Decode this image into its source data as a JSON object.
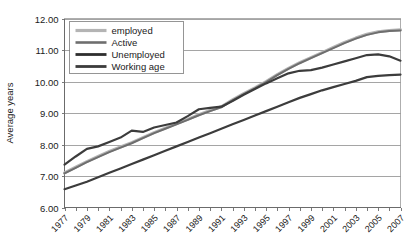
{
  "chart_data": {
    "type": "line",
    "title": "",
    "xlabel": "",
    "ylabel": "Average years",
    "ylim": [
      6.0,
      12.0
    ],
    "ytick_step": 1.0,
    "ytick_labels": [
      "6.00",
      "7.00",
      "8.00",
      "9.00",
      "10.00",
      "11.00",
      "12.00"
    ],
    "ytick_values": [
      6.0,
      7.0,
      8.0,
      9.0,
      10.0,
      11.0,
      12.0
    ],
    "grid": true,
    "grid_axis": "y",
    "legend_position": "top-left",
    "x": [
      1977,
      1978,
      1979,
      1980,
      1981,
      1982,
      1983,
      1984,
      1985,
      1986,
      1987,
      1988,
      1989,
      1990,
      1991,
      1992,
      1993,
      1994,
      1995,
      1996,
      1997,
      1998,
      1999,
      2000,
      2001,
      2002,
      2003,
      2004,
      2005,
      2006,
      2007
    ],
    "xtick_labels": [
      "1977",
      "1979",
      "1981",
      "1983",
      "1985",
      "1987",
      "1989",
      "1991",
      "1993",
      "1995",
      "1997",
      "1999",
      "2001",
      "2003",
      "2005",
      "2007"
    ],
    "xtick_values": [
      1977,
      1979,
      1981,
      1983,
      1985,
      1987,
      1989,
      1991,
      1993,
      1995,
      1997,
      1999,
      2001,
      2003,
      2005,
      2007
    ],
    "xlim": [
      1977,
      2007
    ],
    "series": [
      {
        "name": "employed",
        "color": "#b4b4b4",
        "width": 3.0,
        "values": [
          7.1,
          7.28,
          7.46,
          7.62,
          7.78,
          7.92,
          8.06,
          8.22,
          8.38,
          8.52,
          8.66,
          8.8,
          8.95,
          9.08,
          9.2,
          9.42,
          9.62,
          9.8,
          10.0,
          10.22,
          10.42,
          10.6,
          10.76,
          10.92,
          11.08,
          11.24,
          11.38,
          11.5,
          11.58,
          11.62,
          11.64
        ]
      },
      {
        "name": "Active",
        "color": "#6e6e6e",
        "width": 2.0,
        "values": [
          7.08,
          7.26,
          7.44,
          7.6,
          7.76,
          7.9,
          8.04,
          8.2,
          8.36,
          8.5,
          8.64,
          8.78,
          8.93,
          9.06,
          9.18,
          9.4,
          9.6,
          9.78,
          9.98,
          10.2,
          10.4,
          10.58,
          10.74,
          10.9,
          11.06,
          11.22,
          11.36,
          11.48,
          11.56,
          11.6,
          11.62
        ]
      },
      {
        "name": "Unemployed",
        "color": "#3c3c3c",
        "width": 2.2,
        "values": [
          7.36,
          7.62,
          7.86,
          7.94,
          8.08,
          8.22,
          8.44,
          8.4,
          8.54,
          8.62,
          8.7,
          8.9,
          9.12,
          9.16,
          9.2,
          9.38,
          9.58,
          9.76,
          9.94,
          10.1,
          10.26,
          10.34,
          10.36,
          10.44,
          10.54,
          10.64,
          10.74,
          10.84,
          10.86,
          10.8,
          10.66
        ]
      },
      {
        "name": "Working age",
        "color": "#3c3c3c",
        "width": 2.2,
        "values": [
          6.58,
          6.7,
          6.82,
          6.96,
          7.1,
          7.24,
          7.38,
          7.52,
          7.66,
          7.8,
          7.94,
          8.08,
          8.22,
          8.36,
          8.5,
          8.64,
          8.78,
          8.92,
          9.06,
          9.2,
          9.34,
          9.48,
          9.6,
          9.72,
          9.82,
          9.92,
          10.02,
          10.14,
          10.18,
          10.2,
          10.22
        ]
      }
    ],
    "legend_entries": [
      {
        "label": "employed",
        "color": "#b4b4b4",
        "width": 3.2
      },
      {
        "label": "Active",
        "color": "#6e6e6e",
        "width": 2.6
      },
      {
        "label": "Unemployed",
        "color": "#2e2e2e",
        "width": 2.8
      },
      {
        "label": "Working age",
        "color": "#3c3c3c",
        "width": 2.8
      }
    ]
  }
}
